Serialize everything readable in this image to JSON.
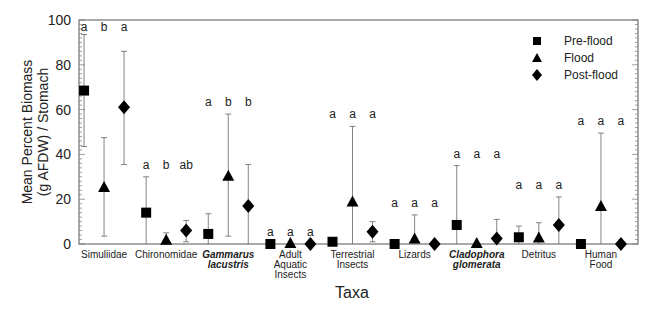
{
  "chart_data": {
    "type": "scatter",
    "title": "",
    "xlabel": "Taxa",
    "ylabel": "Mean Percent Biomass (g AFDW) / Stomach",
    "ylabel_lines": [
      "Mean Percent Biomass",
      "(g AFDW) / Stomach"
    ],
    "ylim": [
      0,
      100
    ],
    "yticks": [
      0,
      20,
      40,
      60,
      80,
      100
    ],
    "grid": false,
    "legend_position": "top-right",
    "categories": [
      {
        "lines": [
          "Simuliidae"
        ],
        "italic": false
      },
      {
        "lines": [
          "Chironomidae"
        ],
        "italic": false
      },
      {
        "lines": [
          "Gammarus",
          "lacustris"
        ],
        "italic": true
      },
      {
        "lines": [
          "Adult",
          "Aquatic",
          "Insects"
        ],
        "italic": false
      },
      {
        "lines": [
          "Terrestrial",
          "Insects"
        ],
        "italic": false
      },
      {
        "lines": [
          "Lizards"
        ],
        "italic": false
      },
      {
        "lines": [
          "Cladophora",
          "glomerata"
        ],
        "italic": true
      },
      {
        "lines": [
          "Detritus"
        ],
        "italic": false
      },
      {
        "lines": [
          "Human",
          "Food"
        ],
        "italic": false
      }
    ],
    "series": [
      {
        "name": "Pre-flood",
        "marker": "square",
        "values": [
          68.5,
          14,
          4.5,
          0,
          1,
          0,
          8.5,
          3,
          0
        ],
        "upper": [
          93.5,
          30,
          13.5,
          null,
          null,
          null,
          35,
          8,
          null
        ],
        "lower": [
          43.5,
          0,
          0,
          null,
          null,
          null,
          0,
          0,
          null
        ],
        "letters": [
          "a",
          "a",
          "a",
          "a",
          "a",
          "a",
          "a",
          "a",
          "a"
        ]
      },
      {
        "name": "Flood",
        "marker": "triangle",
        "values": [
          25,
          1.5,
          30,
          0,
          18.5,
          2,
          0,
          2.5,
          16.5
        ],
        "upper": [
          47.5,
          5,
          58,
          null,
          52.5,
          13,
          null,
          9.5,
          49.5
        ],
        "lower": [
          3.5,
          0,
          3.5,
          null,
          0,
          0,
          null,
          0,
          0
        ],
        "letters": [
          "b",
          "b",
          "b",
          "a",
          "a",
          "a",
          "a",
          "a",
          "a"
        ]
      },
      {
        "name": "Post-flood",
        "marker": "diamond",
        "values": [
          61,
          6,
          17,
          0,
          5.5,
          0,
          2.5,
          8.5,
          0
        ],
        "upper": [
          86,
          10.5,
          35.5,
          null,
          10,
          null,
          11,
          21,
          null
        ],
        "lower": [
          35.5,
          1,
          0,
          null,
          1,
          null,
          0,
          0,
          null
        ],
        "letters": [
          "a",
          "ab",
          "b",
          "a",
          "a",
          "a",
          "a",
          "a",
          "a"
        ]
      }
    ]
  }
}
